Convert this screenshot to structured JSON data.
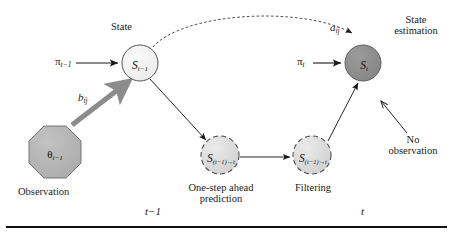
{
  "figure": {
    "background": "#ffffff",
    "ink_color": "#1a1a1a"
  },
  "nodes": {
    "state_prev": {
      "id": "S-t-minus-1",
      "label_base": "S",
      "label_sub": "t−1",
      "caption": "State",
      "fill": "#f2f2f2",
      "stroke": "#4d4d4d",
      "shape": "circle",
      "cx": 140,
      "cy": 63,
      "r": 18
    },
    "state_now": {
      "id": "S-t",
      "label_base": "S",
      "label_sub": "t",
      "caption": "State estimation",
      "caption_line1": "State",
      "caption_line2": "estimation",
      "fill": "#8c8c8c",
      "stroke": "#555555",
      "shape": "circle",
      "cx": 363,
      "cy": 63,
      "r": 18
    },
    "prediction": {
      "id": "S-one-step-ahead",
      "label_base": "S",
      "label_sub": "(t−1)→t",
      "caption_line1": "One-step ahead",
      "caption_line2": "prediction",
      "fill": "#d9d9d9",
      "stroke": "#555555",
      "shape": "dashed-circle",
      "cx": 220,
      "cy": 155,
      "r": 19
    },
    "filtering": {
      "id": "S-filtering",
      "label_base": "S",
      "label_sub": "(t−1)→t",
      "caption_line1": "Filtering",
      "caption_line2": "",
      "fill": "#d9d9d9",
      "stroke": "#555555",
      "shape": "dashed-circle",
      "cx": 312,
      "cy": 155,
      "r": 19
    },
    "observation": {
      "id": "theta-t-minus-1",
      "label_base": "θ",
      "label_sub": "t−1",
      "caption": "Observation",
      "fill": "#b3b3b3",
      "stroke": "#666666",
      "shape": "octagon",
      "cx": 55,
      "cy": 152,
      "r": 26
    }
  },
  "edges": {
    "pi_prev": {
      "label_base": "π",
      "label_sub": "t−1",
      "kind": "straight-arrow"
    },
    "pi_now": {
      "label_base": "π",
      "label_sub": "t",
      "kind": "straight-arrow"
    },
    "b_ij": {
      "label_base": "b",
      "label_sub": "ij",
      "kind": "thick-gray-arrow",
      "color": "#8c8c8c"
    },
    "a_ij": {
      "label_base": "a",
      "label_sub": "ij",
      "kind": "dashed-curved-arrow"
    },
    "state_to_prediction": {
      "kind": "straight-arrow"
    },
    "prediction_to_filtering": {
      "kind": "straight-arrow"
    },
    "filtering_to_state": {
      "kind": "straight-arrow"
    },
    "no_observation": {
      "kind": "pointer-arrow",
      "label_line1": "No",
      "label_line2": "observation"
    }
  },
  "axis": {
    "tick_left": "t−1",
    "tick_right": "t"
  }
}
